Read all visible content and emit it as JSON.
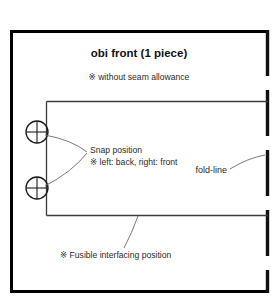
{
  "page": {
    "width": 279,
    "height": 306,
    "background": "#ffffff"
  },
  "diagram": {
    "title": "obi front (1 piece)",
    "subtitle": "※ without seam allowance",
    "labels": {
      "snap_position": "Snap position",
      "snap_note": "※  left: back, right: front",
      "fold_line": "fold-line",
      "fusible_interfacing": "※ Fusible interfacing position"
    },
    "colors": {
      "outer_border": "#000000",
      "fold_line": "#111111",
      "piece_outline": "#3a3a3a",
      "leader_line": "#6b6b6b",
      "snap_marker": "#1a1a1a",
      "title_text": "#111111",
      "body_text": "#2b2b2b"
    },
    "markers": {
      "snap_count": 2,
      "snap_symbol": "circle-crosshair"
    },
    "geometry": {
      "outer_border": {
        "x": 10,
        "y": 30,
        "width": 259,
        "height": 263
      },
      "piece_rect": {
        "x": 46,
        "y": 101,
        "width": 223,
        "height": 114
      },
      "fold_edge": "dashed-right-edge",
      "snap_1": {
        "cx": 37,
        "cy": 132,
        "r": 11
      },
      "snap_2": {
        "cx": 37,
        "cy": 188,
        "r": 11
      }
    }
  }
}
